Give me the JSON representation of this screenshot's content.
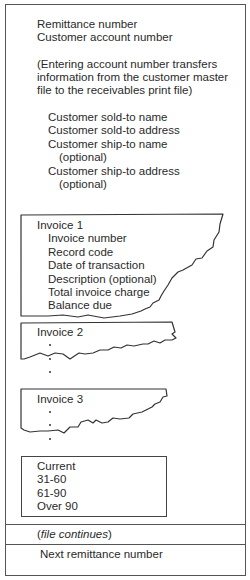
{
  "header_fields": {
    "remittance": "Remittance number",
    "account": "Customer account number"
  },
  "note": {
    "line1": "(Entering account number transfers",
    "line2": "information from the customer master",
    "line3": "file to the receivables print file)"
  },
  "customer_fields": {
    "sold_to_name": "Customer sold-to name",
    "sold_to_address": "Customer sold-to address",
    "ship_to_name": "Customer ship-to name",
    "ship_to_name_opt": "(optional)",
    "ship_to_address": "Customer ship-to address",
    "ship_to_address_opt": "(optional)"
  },
  "invoices": [
    {
      "title": "Invoice 1",
      "fields": [
        "Invoice number",
        "Record code",
        "Date of transaction",
        "Description (optional)",
        "Total invoice charge",
        "Balance due"
      ]
    },
    {
      "title": "Invoice 2"
    },
    {
      "title": "Invoice 3"
    }
  ],
  "aging": [
    "Current",
    "31-60",
    "61-90",
    "Over 90"
  ],
  "footer": {
    "continues_open": "(",
    "continues_italic": "file continues",
    "continues_close": ")",
    "next": "Next remittance number"
  }
}
